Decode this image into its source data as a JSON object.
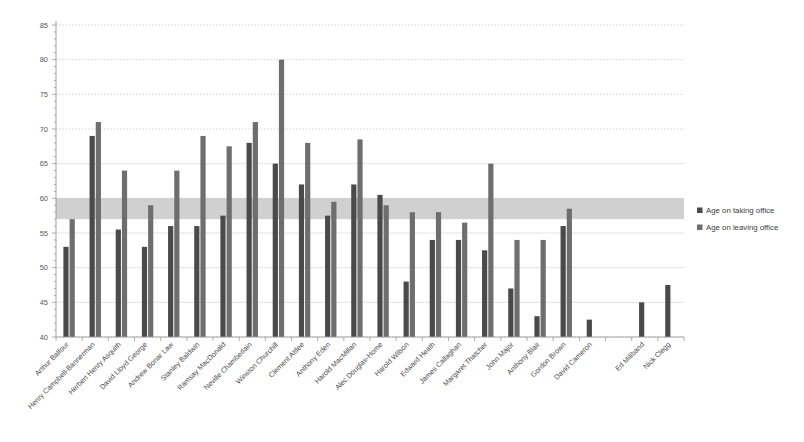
{
  "chart_data": {
    "type": "bar",
    "title": "",
    "subtitle": "",
    "xlabel": "",
    "ylabel": "",
    "ylim": [
      40,
      85
    ],
    "ytick_step": 5,
    "yticks": [
      40,
      45,
      50,
      55,
      60,
      65,
      70,
      75,
      80,
      85
    ],
    "grid": true,
    "legend_position": "right",
    "categories": [
      "Arthur Balfour",
      "Henry Campbell-Bannerman",
      "Herbert Henry Asquith",
      "David Lloyd George",
      "Andrew Bonar Law",
      "Stanley Baldwin",
      "Ramsay MacDonald",
      "Neville Chamberlain",
      "Winston Churchill",
      "Clement Attlee",
      "Anthony Eden",
      "Harold MacMillan",
      "Alec Douglas-Home",
      "Harold Wilson",
      "Edward Heath",
      "James Callaghan",
      "Margaret Thatcher",
      "John Major",
      "Anthony Blair",
      "Gordon Brown",
      "David Cameron",
      "",
      "Ed Miliband",
      "Nick Clegg"
    ],
    "series": [
      {
        "name": "Age on taking office",
        "color": "#4a4a4a",
        "values": [
          53,
          69,
          55.5,
          53,
          56,
          56,
          57.5,
          68,
          65,
          62,
          57.5,
          62,
          60.5,
          48,
          54,
          54,
          52.5,
          47,
          43,
          56,
          42.5,
          null,
          45,
          47.5
        ]
      },
      {
        "name": "Age on leaving office",
        "color": "#6e6e6e",
        "values": [
          57,
          71,
          64,
          59,
          64,
          69,
          67.5,
          71,
          80,
          68,
          59.5,
          68.5,
          59,
          58,
          58,
          56.5,
          65,
          54,
          54,
          58.5,
          null,
          null,
          null,
          null
        ]
      }
    ],
    "highlight_band": {
      "from": 57,
      "to": 60,
      "color": "#b3b3b3",
      "label": ""
    }
  },
  "legend": {
    "items": [
      {
        "label": "Age on taking office",
        "swatch": "#4a4a4a"
      },
      {
        "label": "Age on leaving office",
        "swatch": "#6e6e6e"
      }
    ]
  }
}
